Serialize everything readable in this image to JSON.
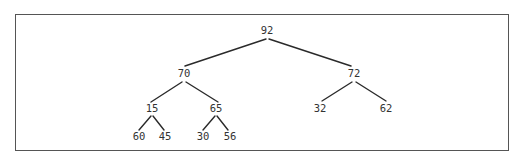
{
  "diagram": {
    "type": "binary-tree",
    "nodes": [
      {
        "id": "n0",
        "label": "92",
        "x": 267,
        "y": 31
      },
      {
        "id": "n1",
        "label": "70",
        "x": 184,
        "y": 74
      },
      {
        "id": "n2",
        "label": "72",
        "x": 354,
        "y": 74
      },
      {
        "id": "n3",
        "label": "15",
        "x": 152,
        "y": 109
      },
      {
        "id": "n4",
        "label": "65",
        "x": 216,
        "y": 109
      },
      {
        "id": "n5",
        "label": "32",
        "x": 320,
        "y": 109
      },
      {
        "id": "n6",
        "label": "62",
        "x": 386,
        "y": 109
      },
      {
        "id": "n7",
        "label": "60",
        "x": 139,
        "y": 137
      },
      {
        "id": "n8",
        "label": "45",
        "x": 165,
        "y": 137
      },
      {
        "id": "n9",
        "label": "30",
        "x": 203,
        "y": 137
      },
      {
        "id": "n10",
        "label": "56",
        "x": 230,
        "y": 137
      }
    ],
    "edges": [
      {
        "from": "n0",
        "to": "n1"
      },
      {
        "from": "n0",
        "to": "n2"
      },
      {
        "from": "n1",
        "to": "n3"
      },
      {
        "from": "n1",
        "to": "n4"
      },
      {
        "from": "n2",
        "to": "n5"
      },
      {
        "from": "n2",
        "to": "n6"
      },
      {
        "from": "n3",
        "to": "n7"
      },
      {
        "from": "n3",
        "to": "n8"
      },
      {
        "from": "n4",
        "to": "n9"
      },
      {
        "from": "n4",
        "to": "n10"
      }
    ],
    "colors": {
      "edge": "#2a2a2a",
      "text": "#333333",
      "border": "#555555",
      "background": "#ffffff"
    }
  }
}
